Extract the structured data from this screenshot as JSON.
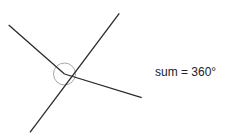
{
  "diagram": {
    "type": "angles-around-a-point",
    "label": "sum = 360°",
    "colors": {
      "line": "#2a2a2a",
      "circle": "#a8a8a8",
      "text": "#222222",
      "background": "#ffffff"
    },
    "center": {
      "x": 64.5,
      "y": 74
    },
    "circle_radius": 11,
    "lines": [
      {
        "x1": 8.7,
        "y1": 25,
        "x2": 64.5,
        "y2": 74
      },
      {
        "x1": 119.3,
        "y1": 13.3,
        "x2": 30,
        "y2": 132.3
      },
      {
        "x1": 64.5,
        "y1": 74,
        "x2": 141.7,
        "y2": 97.7
      }
    ]
  }
}
